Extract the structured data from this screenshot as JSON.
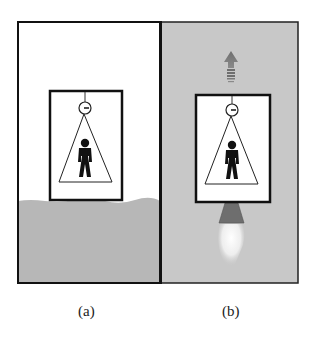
{
  "figure": {
    "panels": [
      {
        "label": "(a)",
        "description": "Elevator resting on ground",
        "background": "#ffffff",
        "ground_color": "#b7b7b7"
      },
      {
        "label": "(b)",
        "description": "Elevator accelerating upward by rocket in space",
        "background": "#c8c8c8",
        "arrow_color": "#7a7a7a",
        "nozzle_color": "#6e6e6e",
        "flame_color": "#f4f4f4"
      }
    ],
    "icons": [
      "person-icon",
      "ceiling-lamp-icon",
      "up-arrow-icon",
      "rocket-nozzle-icon",
      "flame-icon"
    ]
  }
}
